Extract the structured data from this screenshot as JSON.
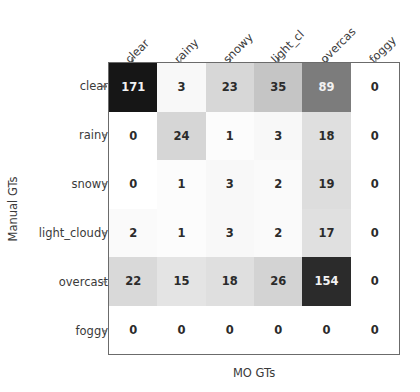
{
  "chart_data": {
    "type": "heatmap",
    "title": "",
    "xlabel": "MO GTs",
    "ylabel": "Manual GTs",
    "x_categories": [
      "clear",
      "rainy",
      "snowy",
      "light_cloudy",
      "overcast",
      "foggy"
    ],
    "y_categories": [
      "clear",
      "rainy",
      "snowy",
      "light_cloudy",
      "overcast",
      "foggy"
    ],
    "x_tick_labels_rendered": [
      "clear",
      "rainy",
      "snowy",
      "light_cl",
      "overcas",
      "foggy"
    ],
    "x_tick_label_rotation": 45,
    "grid": false,
    "legend": "none",
    "colormap": "Greys",
    "value_range": [
      0,
      171
    ],
    "matrix": [
      [
        171,
        3,
        23,
        35,
        89,
        0
      ],
      [
        0,
        24,
        1,
        3,
        18,
        0
      ],
      [
        0,
        1,
        3,
        2,
        19,
        0
      ],
      [
        2,
        1,
        3,
        2,
        17,
        0
      ],
      [
        22,
        15,
        18,
        26,
        154,
        0
      ],
      [
        0,
        0,
        0,
        0,
        0,
        0
      ]
    ],
    "rows": [
      {
        "label": "clear",
        "values": [
          171,
          3,
          23,
          35,
          89,
          0
        ]
      },
      {
        "label": "rainy",
        "values": [
          0,
          24,
          1,
          3,
          18,
          0
        ]
      },
      {
        "label": "snowy",
        "values": [
          0,
          1,
          3,
          2,
          19,
          0
        ]
      },
      {
        "label": "light_cloudy",
        "values": [
          2,
          1,
          3,
          2,
          17,
          0
        ]
      },
      {
        "label": "overcast",
        "values": [
          22,
          15,
          18,
          26,
          154,
          0
        ]
      },
      {
        "label": "foggy",
        "values": [
          0,
          0,
          0,
          0,
          0,
          0
        ]
      }
    ],
    "colors": {
      "axis": "#6b6b6b",
      "text": "#3a3a3a",
      "cell_low": "#ffffff",
      "cell_high": "#2b2b2b",
      "value_text_light": "#f2f2f2",
      "value_text_dark": "#2b2b2b"
    }
  }
}
